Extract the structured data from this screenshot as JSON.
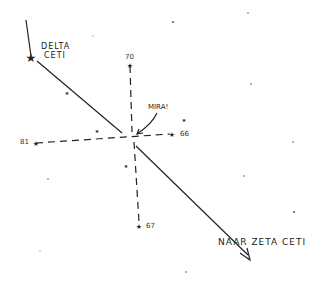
{
  "labels": {
    "delta_1": "DELTA",
    "delta_2": "CETI",
    "mira": "MIRA!",
    "zeta": "NAAR ZETA CETI",
    "s70": "70",
    "s66": "66",
    "s81": "81",
    "s67": "67"
  },
  "colors": {
    "ink": "#222222",
    "background": "#ffffff"
  }
}
